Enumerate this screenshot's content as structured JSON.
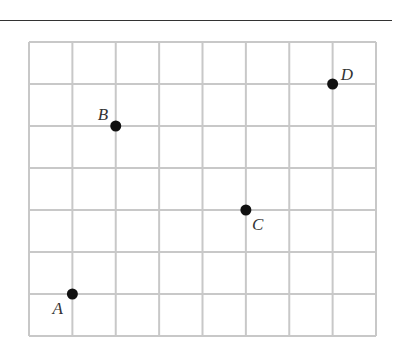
{
  "diagram": {
    "type": "coordinate-grid",
    "columns": 8,
    "rows": 7,
    "grid_color": "#c8c8c8",
    "point_color": "#111111",
    "points": [
      {
        "label": "A",
        "col": 1,
        "row": 6,
        "label_dx": -20,
        "label_dy": 20
      },
      {
        "label": "B",
        "col": 2,
        "row": 2,
        "label_dx": -18,
        "label_dy": -6
      },
      {
        "label": "C",
        "col": 5,
        "row": 4,
        "label_dx": 6,
        "label_dy": 20
      },
      {
        "label": "D",
        "col": 7,
        "row": 1,
        "label_dx": 8,
        "label_dy": -4
      }
    ]
  }
}
